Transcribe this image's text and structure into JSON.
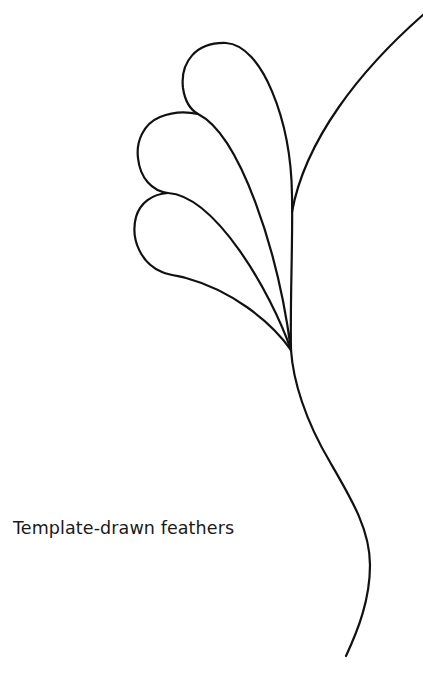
{
  "figure": {
    "caption": "Template-drawn feathers",
    "stroke_color": "#111111",
    "background_color": "#ffffff",
    "elements": [
      {
        "name": "top-feather",
        "description": "Teardrop-shaped feather plume, topmost"
      },
      {
        "name": "middle-feather",
        "description": "Teardrop-shaped feather plume, middle"
      },
      {
        "name": "bottom-feather",
        "description": "Teardrop-shaped feather plume, bottom"
      },
      {
        "name": "right-stem-curve",
        "description": "Curved line sweeping from top-right into the spine"
      },
      {
        "name": "main-spine",
        "description": "S-curved spine running from feather base to the bottom"
      }
    ]
  }
}
